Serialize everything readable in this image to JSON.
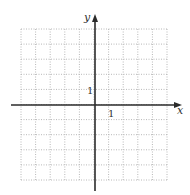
{
  "diagram": {
    "type": "coordinate-grid",
    "x_axis_label": "x",
    "y_axis_label": "y",
    "x_tick_label": "1",
    "y_tick_label": "1",
    "x_range": [
      -5,
      5
    ],
    "y_range": [
      -5,
      5
    ],
    "grid_cells": {
      "columns": 10,
      "rows": 10
    },
    "colors": {
      "axis": "#2b2b2b",
      "grid": "#b8b8b8",
      "text": "#333333"
    }
  }
}
